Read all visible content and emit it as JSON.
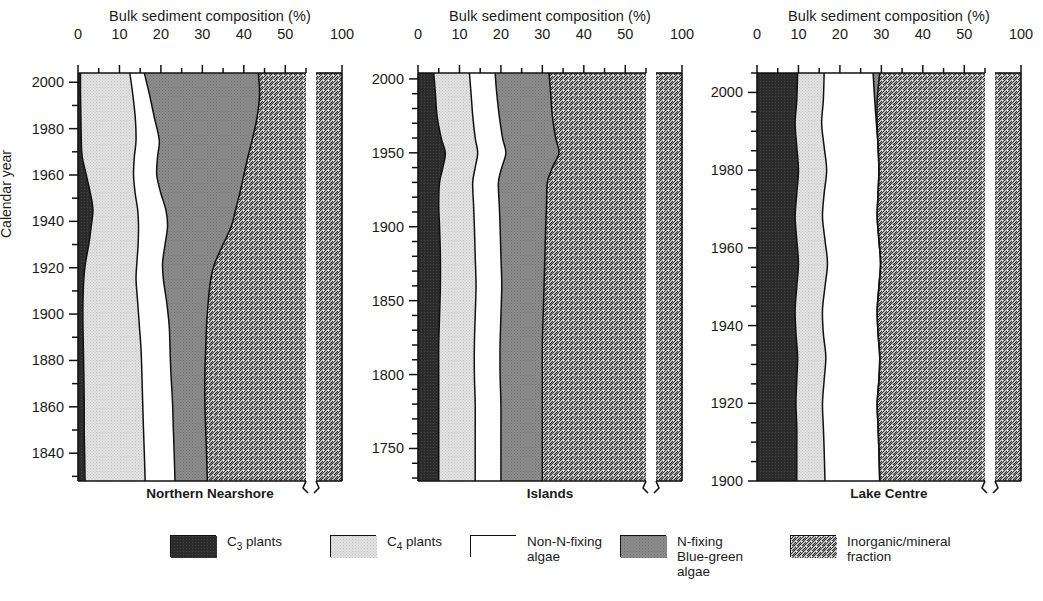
{
  "figure": {
    "x_axis_title": "Bulk sediment composition (%)",
    "y_axis_title": "Calendar year"
  },
  "legend": {
    "items": [
      {
        "name": "c3-plants",
        "label": "C3 plants",
        "label_main": "C",
        "label_sub": "3",
        "label_rest": " plants",
        "fill": "#2b2b2b",
        "pattern": "solid-dark"
      },
      {
        "name": "c4-plants",
        "label": "C4 plants",
        "label_main": "C",
        "label_sub": "4",
        "label_rest": " plants",
        "fill": "#dcdcdc",
        "pattern": "light-stipple"
      },
      {
        "name": "non-n-fixing-algae",
        "label": "Non-N-fixing\nalgae",
        "fill": "#ffffff",
        "pattern": "none"
      },
      {
        "name": "n-fixing-blue-green-algae",
        "label": "N-fixing\nBlue-green\nalgae",
        "fill": "#8c8c8c",
        "pattern": "mid-stipple"
      },
      {
        "name": "inorganic-mineral-fraction",
        "label": "Inorganic/mineral\nfraction",
        "fill": "#ffffff",
        "pattern": "diagonal-hatch"
      }
    ]
  },
  "chart_data": {
    "type": "area",
    "title": "Bulk sediment composition (%)",
    "xlabel": "Bulk sediment composition (%)",
    "ylabel": "Calendar year",
    "orientation": "horizontal-stacked-vs-depth",
    "axis_break": {
      "present": true,
      "between": [
        55,
        95
      ],
      "note": "x-axis broken between ~55% and 100%"
    },
    "xlim": [
      0,
      100
    ],
    "xticks": [
      0,
      10,
      20,
      30,
      40,
      50,
      100
    ],
    "xtick_labels": [
      "0",
      "10",
      "20",
      "30",
      "40",
      "50",
      "100"
    ],
    "minor_ticks_every": 5,
    "grid": false,
    "legend_position": "bottom",
    "series_names": [
      "C3 plants",
      "C4 plants",
      "Non-N-fixing algae",
      "N-fixing Blue-green algae",
      "Inorganic/mineral fraction"
    ],
    "panels": [
      {
        "name": "Northern Nearshore",
        "ylim": [
          1828,
          2004
        ],
        "yticks": [
          2000,
          1980,
          1960,
          1940,
          1920,
          1900,
          1880,
          1860,
          1840
        ],
        "minor_ytick_every": 10,
        "years": [
          2004,
          1995,
          1985,
          1975,
          1968,
          1960,
          1952,
          1945,
          1938,
          1930,
          1922,
          1915,
          1905,
          1895,
          1885,
          1875,
          1862,
          1850,
          1840,
          1828
        ],
        "c3_cum": [
          0.6,
          0.6,
          0.7,
          0.8,
          1.0,
          2.0,
          3.0,
          3.6,
          3.2,
          2.6,
          1.8,
          1.4,
          1.2,
          1.2,
          1.3,
          1.4,
          1.5,
          1.5,
          1.6,
          1.7
        ],
        "c4_cum": [
          12.5,
          13.2,
          13.8,
          14.0,
          13.6,
          13.4,
          13.8,
          14.4,
          14.6,
          14.5,
          14.2,
          14.0,
          14.4,
          14.8,
          15.2,
          15.4,
          15.6,
          15.8,
          16.0,
          16.2
        ],
        "non_n_fixing_cum": [
          16.0,
          17.2,
          18.4,
          19.6,
          19.2,
          19.0,
          20.0,
          21.2,
          21.6,
          21.0,
          20.4,
          20.6,
          21.4,
          22.0,
          22.2,
          22.4,
          22.8,
          23.0,
          23.2,
          23.4
        ],
        "n_fixing_cum": [
          43.5,
          43.8,
          43.2,
          42.0,
          41.0,
          40.0,
          39.0,
          38.0,
          37.0,
          35.0,
          33.0,
          32.0,
          31.4,
          31.0,
          30.8,
          30.6,
          30.6,
          30.8,
          31.0,
          31.2
        ],
        "total": 100
      },
      {
        "name": "Islands",
        "ylim": [
          1728,
          2004
        ],
        "yticks": [
          2000,
          1950,
          1900,
          1850,
          1800,
          1750
        ],
        "minor_ytick_every": 10,
        "years": [
          2004,
          1990,
          1975,
          1960,
          1950,
          1940,
          1930,
          1915,
          1900,
          1880,
          1860,
          1840,
          1820,
          1800,
          1780,
          1760,
          1745,
          1728
        ],
        "c3_cum": [
          3.8,
          4.2,
          4.6,
          5.6,
          6.6,
          6.0,
          5.2,
          5.0,
          5.2,
          5.4,
          5.4,
          5.2,
          5.0,
          5.0,
          5.0,
          5.0,
          5.0,
          5.0
        ],
        "c4_cum": [
          12.4,
          12.8,
          13.2,
          13.8,
          14.4,
          13.8,
          13.2,
          13.4,
          13.6,
          13.8,
          14.0,
          13.8,
          13.6,
          13.6,
          13.8,
          13.8,
          13.8,
          13.8
        ],
        "non_n_fixing_cum": [
          18.6,
          19.0,
          19.6,
          20.4,
          21.2,
          20.2,
          19.4,
          19.6,
          19.8,
          20.0,
          20.2,
          20.0,
          19.8,
          19.8,
          20.0,
          20.0,
          20.0,
          20.0
        ],
        "n_fixing_cum": [
          31.6,
          32.0,
          32.4,
          33.2,
          34.0,
          32.4,
          31.2,
          31.0,
          30.8,
          30.6,
          30.4,
          30.2,
          30.0,
          30.0,
          30.0,
          30.0,
          30.0,
          30.0
        ],
        "total": 100
      },
      {
        "name": "Lake Centre",
        "ylim": [
          1900,
          2005
        ],
        "yticks": [
          2000,
          1980,
          1960,
          1940,
          1920,
          1900
        ],
        "minor_ytick_every": 5,
        "years": [
          2005,
          1998,
          1992,
          1986,
          1980,
          1974,
          1968,
          1962,
          1956,
          1950,
          1944,
          1938,
          1932,
          1926,
          1920,
          1914,
          1908,
          1900
        ],
        "c3_cum": [
          9.8,
          9.6,
          9.2,
          9.6,
          10.0,
          9.6,
          9.2,
          9.6,
          10.0,
          9.6,
          9.2,
          9.4,
          9.8,
          9.6,
          9.4,
          9.6,
          9.6,
          9.6
        ],
        "c4_cum": [
          16.2,
          16.0,
          15.6,
          16.2,
          16.8,
          16.2,
          15.8,
          16.4,
          17.0,
          16.4,
          15.8,
          16.0,
          16.6,
          16.2,
          15.8,
          16.0,
          16.2,
          16.4
        ],
        "non_n_fixing_cum": [
          28.0,
          28.4,
          28.8,
          29.2,
          29.4,
          29.2,
          29.0,
          29.4,
          29.8,
          29.4,
          29.0,
          29.2,
          29.6,
          29.4,
          29.0,
          29.2,
          29.4,
          29.6
        ],
        "n_fixing_cum": [
          29.6,
          29.0,
          29.0,
          29.2,
          29.4,
          29.2,
          29.0,
          29.4,
          29.8,
          29.4,
          29.0,
          29.2,
          29.6,
          29.4,
          29.0,
          29.2,
          29.4,
          29.6
        ],
        "total": 100
      }
    ]
  }
}
